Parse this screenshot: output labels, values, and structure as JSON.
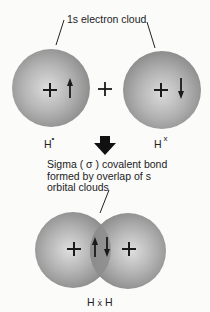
{
  "diagram": {
    "title_label": "1s electron cloud",
    "atoms": {
      "left": {
        "nucleus": "+",
        "spin": "up",
        "label": "H",
        "dot": "•"
      },
      "right": {
        "nucleus": "+",
        "spin": "down",
        "label": "H",
        "dot": "x"
      }
    },
    "plus_between": "+",
    "arrow": "down-arrow",
    "caption": {
      "line1": "Sigma ( σ ) covalent bond",
      "line2": "formed by overlap of s",
      "line3": "orbital clouds"
    },
    "molecule": {
      "label_left": "H",
      "label_mid": "ẋ",
      "label_right": "H",
      "nuclei": [
        "+",
        "+"
      ],
      "spins": [
        "up",
        "down"
      ]
    },
    "colors": {
      "sphere_edge": "#8a8a8a",
      "sphere_center": "#d6d6d6",
      "overlap": "#858585",
      "ink": "#1a1a1a"
    }
  }
}
